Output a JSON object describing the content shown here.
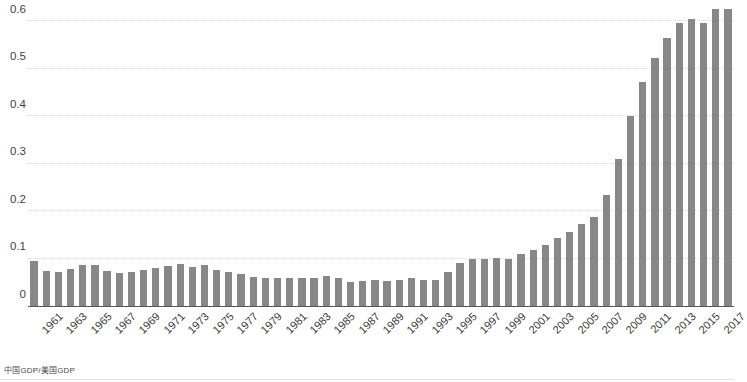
{
  "caption": "中国GDP/美国GDP",
  "colors": {
    "bar": "#878787",
    "gridline": "#d8d8d8",
    "axis": "#555555",
    "tick_text": "#3b3b3b",
    "background": "#ffffff"
  },
  "chart_data": {
    "type": "bar",
    "title": "",
    "subtitle": "",
    "xlabel": "",
    "ylabel": "",
    "ylim": [
      0,
      0.6
    ],
    "yticks": [
      "0",
      "0.1",
      "0.2",
      "0.3",
      "0.4",
      "0.5",
      "0.6"
    ],
    "ytick_values": [
      0,
      0.1,
      0.2,
      0.3,
      0.4,
      0.5,
      0.6
    ],
    "grid": true,
    "legend": "none",
    "xtick_step": 2,
    "xtick_labels": [
      "1961",
      "1963",
      "1965",
      "1967",
      "1969",
      "1971",
      "1973",
      "1975",
      "1977",
      "1979",
      "1981",
      "1983",
      "1985",
      "1987",
      "1989",
      "1991",
      "1993",
      "1995",
      "1997",
      "1999",
      "2001",
      "2003",
      "2005",
      "2007",
      "2009",
      "2011",
      "2013",
      "2015",
      "2017"
    ],
    "categories": [
      "1961",
      "1962",
      "1963",
      "1964",
      "1965",
      "1966",
      "1967",
      "1968",
      "1969",
      "1970",
      "1971",
      "1972",
      "1973",
      "1974",
      "1975",
      "1976",
      "1977",
      "1978",
      "1979",
      "1980",
      "1981",
      "1982",
      "1983",
      "1984",
      "1985",
      "1986",
      "1987",
      "1988",
      "1989",
      "1990",
      "1991",
      "1992",
      "1993",
      "1994",
      "1995",
      "1996",
      "1997",
      "1998",
      "1999",
      "2000",
      "2001",
      "2002",
      "2003",
      "2004",
      "2005",
      "2006",
      "2007",
      "2008",
      "2009",
      "2010",
      "2011",
      "2012",
      "2013",
      "2014",
      "2015",
      "2016",
      "2017",
      "2018"
    ],
    "values": [
      0.095,
      0.073,
      0.071,
      0.077,
      0.086,
      0.086,
      0.073,
      0.069,
      0.071,
      0.076,
      0.079,
      0.085,
      0.088,
      0.082,
      0.086,
      0.076,
      0.072,
      0.068,
      0.062,
      0.058,
      0.059,
      0.059,
      0.058,
      0.058,
      0.063,
      0.058,
      0.05,
      0.052,
      0.054,
      0.053,
      0.055,
      0.058,
      0.055,
      0.055,
      0.071,
      0.091,
      0.1,
      0.1,
      0.102,
      0.1,
      0.11,
      0.118,
      0.128,
      0.143,
      0.155,
      0.172,
      0.187,
      0.233,
      0.31,
      0.4,
      0.472,
      0.522,
      0.565,
      0.595,
      0.605,
      0.595,
      0.625,
      0.625
    ]
  }
}
